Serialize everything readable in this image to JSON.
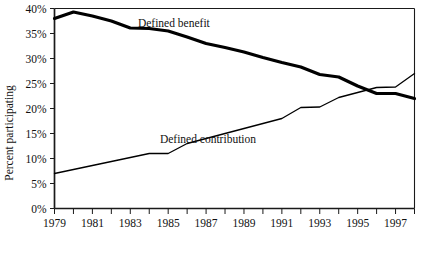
{
  "chart_data": {
    "type": "line",
    "title": "",
    "subtitle": "",
    "xlabel": "",
    "ylabel": "Percent participating",
    "xlim": [
      1979,
      1998
    ],
    "ylim": [
      0,
      40
    ],
    "y_tick_labels": [
      "0%",
      "5%",
      "10%",
      "15%",
      "20%",
      "25%",
      "30%",
      "35%",
      "40%"
    ],
    "y_tick_values": [
      0,
      5,
      10,
      15,
      20,
      25,
      30,
      35,
      40
    ],
    "x_tick_labels": [
      "1979",
      "1981",
      "1983",
      "1985",
      "1987",
      "1989",
      "1991",
      "1993",
      "1995",
      "1997"
    ],
    "x_tick_values": [
      1979,
      1981,
      1983,
      1985,
      1987,
      1989,
      1991,
      1993,
      1995,
      1997
    ],
    "x_minor_values": [
      1979,
      1980,
      1981,
      1982,
      1983,
      1984,
      1985,
      1986,
      1987,
      1988,
      1989,
      1990,
      1991,
      1992,
      1993,
      1994,
      1995,
      1996,
      1997,
      1998
    ],
    "x": [
      1979,
      1980,
      1981,
      1982,
      1983,
      1984,
      1985,
      1986,
      1987,
      1988,
      1989,
      1990,
      1991,
      1992,
      1993,
      1994,
      1995,
      1996,
      1997,
      1998
    ],
    "grid": false,
    "legend_position": "inline-annotations",
    "series": [
      {
        "name": "Defined benefit",
        "label_x": 1985.3,
        "label_y": 36.4,
        "line_width": 3.2,
        "color": "#000000",
        "values": [
          38.0,
          39.3,
          38.5,
          37.5,
          36.1,
          36.0,
          35.5,
          34.3,
          33.0,
          32.2,
          31.3,
          30.2,
          29.2,
          28.3,
          26.8,
          26.3,
          24.5,
          23.0,
          23.0,
          22.0
        ]
      },
      {
        "name": "Defined contribution",
        "label_x": 1987.1,
        "label_y": 13.2,
        "line_width": 1.3,
        "color": "#000000",
        "values": [
          7.0,
          7.8,
          8.6,
          9.4,
          10.2,
          11.0,
          11.0,
          13.0,
          14.0,
          15.0,
          16.0,
          17.0,
          18.0,
          20.2,
          20.3,
          22.2,
          23.2,
          24.2,
          24.3,
          27.0
        ]
      }
    ]
  },
  "axis": {
    "y_axis_title": "Percent participating"
  }
}
